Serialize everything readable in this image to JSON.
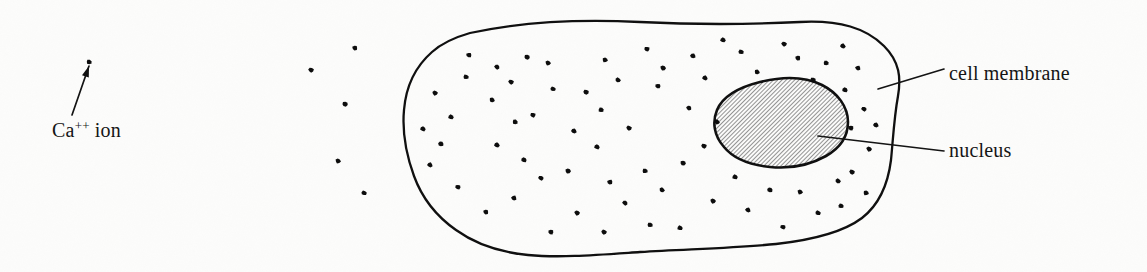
{
  "figure": {
    "kind": "biology-diagram",
    "background_color": "#fcfcfb",
    "ink_color": "#101010"
  },
  "labels": {
    "ca_ion": {
      "base": "Ca",
      "superscript": "++",
      "suffix": "ion",
      "full": "Ca++ ion",
      "x": 52,
      "y": 137
    },
    "cell_membrane": {
      "text": "cell membrane",
      "x": 949,
      "y": 80
    },
    "nucleus": {
      "text": "nucleus",
      "x": 949,
      "y": 157
    }
  },
  "leaders": [
    {
      "name": "ca-ion-arrow",
      "x1": 72,
      "y1": 115,
      "x2": 89,
      "y2": 66
    },
    {
      "name": "cell-membrane-leader",
      "x1": 878,
      "y1": 89,
      "x2": 944,
      "y2": 69
    },
    {
      "name": "nucleus-leader",
      "x1": 818,
      "y1": 136,
      "x2": 944,
      "y2": 151
    }
  ],
  "cell_membrane": {
    "stroke_width": 2.3,
    "path": "M 470,33 C 520,22 580,19 640,22 C 700,25 760,24 800,22 C 840,20 866,28 884,46 C 900,62 901,78 898,96 C 894,118 893,140 891,160 C 888,184 880,204 862,218 C 842,233 812,240 776,244 C 736,248 690,249 640,252 C 596,255 560,258 528,255 C 498,252 474,243 456,230 C 436,216 422,198 414,176 C 406,154 402,132 404,110 C 406,86 416,66 432,52 C 443,42 456,37 470,33 Z"
  },
  "nucleus": {
    "stroke_width": 2.6,
    "hatch_color": "#3c3c3c",
    "hatch_angle_deg": 45,
    "hatch_spacing": 3,
    "path": "M 760,82 C 784,76 806,77 822,85 C 838,93 848,107 848,122 C 848,136 840,148 826,156 C 810,165 790,169 770,167 C 750,165 733,158 724,147 C 714,136 712,122 717,110 C 722,98 736,88 760,82 Z"
  },
  "ions": {
    "inside_count": 72,
    "outside_count": 5,
    "dot_size": 5.4,
    "outside": [
      {
        "x": 355,
        "y": 48
      },
      {
        "x": 311,
        "y": 70
      },
      {
        "x": 345,
        "y": 104
      },
      {
        "x": 338,
        "y": 161
      },
      {
        "x": 364,
        "y": 193
      },
      {
        "x": 89,
        "y": 62
      }
    ],
    "inside": [
      {
        "x": 435,
        "y": 93
      },
      {
        "x": 466,
        "y": 77
      },
      {
        "x": 492,
        "y": 100
      },
      {
        "x": 451,
        "y": 117
      },
      {
        "x": 441,
        "y": 144
      },
      {
        "x": 430,
        "y": 165
      },
      {
        "x": 458,
        "y": 187
      },
      {
        "x": 486,
        "y": 212
      },
      {
        "x": 511,
        "y": 82
      },
      {
        "x": 527,
        "y": 57
      },
      {
        "x": 548,
        "y": 63
      },
      {
        "x": 553,
        "y": 89
      },
      {
        "x": 515,
        "y": 122
      },
      {
        "x": 497,
        "y": 145
      },
      {
        "x": 524,
        "y": 160
      },
      {
        "x": 514,
        "y": 198
      },
      {
        "x": 541,
        "y": 178
      },
      {
        "x": 551,
        "y": 232
      },
      {
        "x": 577,
        "y": 213
      },
      {
        "x": 586,
        "y": 92
      },
      {
        "x": 605,
        "y": 60
      },
      {
        "x": 618,
        "y": 80
      },
      {
        "x": 601,
        "y": 110
      },
      {
        "x": 574,
        "y": 131
      },
      {
        "x": 597,
        "y": 147
      },
      {
        "x": 610,
        "y": 182
      },
      {
        "x": 625,
        "y": 203
      },
      {
        "x": 647,
        "y": 49
      },
      {
        "x": 663,
        "y": 68
      },
      {
        "x": 629,
        "y": 128
      },
      {
        "x": 645,
        "y": 171
      },
      {
        "x": 662,
        "y": 190
      },
      {
        "x": 680,
        "y": 228
      },
      {
        "x": 693,
        "y": 56
      },
      {
        "x": 705,
        "y": 78
      },
      {
        "x": 658,
        "y": 86
      },
      {
        "x": 689,
        "y": 108
      },
      {
        "x": 704,
        "y": 146
      },
      {
        "x": 683,
        "y": 163
      },
      {
        "x": 713,
        "y": 201
      },
      {
        "x": 741,
        "y": 52
      },
      {
        "x": 757,
        "y": 72
      },
      {
        "x": 723,
        "y": 40
      },
      {
        "x": 770,
        "y": 190
      },
      {
        "x": 748,
        "y": 210
      },
      {
        "x": 783,
        "y": 227
      },
      {
        "x": 798,
        "y": 58
      },
      {
        "x": 784,
        "y": 44
      },
      {
        "x": 813,
        "y": 80
      },
      {
        "x": 800,
        "y": 192
      },
      {
        "x": 818,
        "y": 213
      },
      {
        "x": 826,
        "y": 63
      },
      {
        "x": 843,
        "y": 46
      },
      {
        "x": 845,
        "y": 90
      },
      {
        "x": 858,
        "y": 68
      },
      {
        "x": 864,
        "y": 109
      },
      {
        "x": 851,
        "y": 128
      },
      {
        "x": 869,
        "y": 149
      },
      {
        "x": 852,
        "y": 172
      },
      {
        "x": 866,
        "y": 193
      },
      {
        "x": 838,
        "y": 181
      },
      {
        "x": 841,
        "y": 206
      },
      {
        "x": 876,
        "y": 125
      },
      {
        "x": 423,
        "y": 129
      },
      {
        "x": 469,
        "y": 55
      },
      {
        "x": 497,
        "y": 67
      },
      {
        "x": 533,
        "y": 115
      },
      {
        "x": 568,
        "y": 171
      },
      {
        "x": 604,
        "y": 232
      },
      {
        "x": 650,
        "y": 225
      },
      {
        "x": 717,
        "y": 122
      },
      {
        "x": 735,
        "y": 177
      }
    ]
  }
}
